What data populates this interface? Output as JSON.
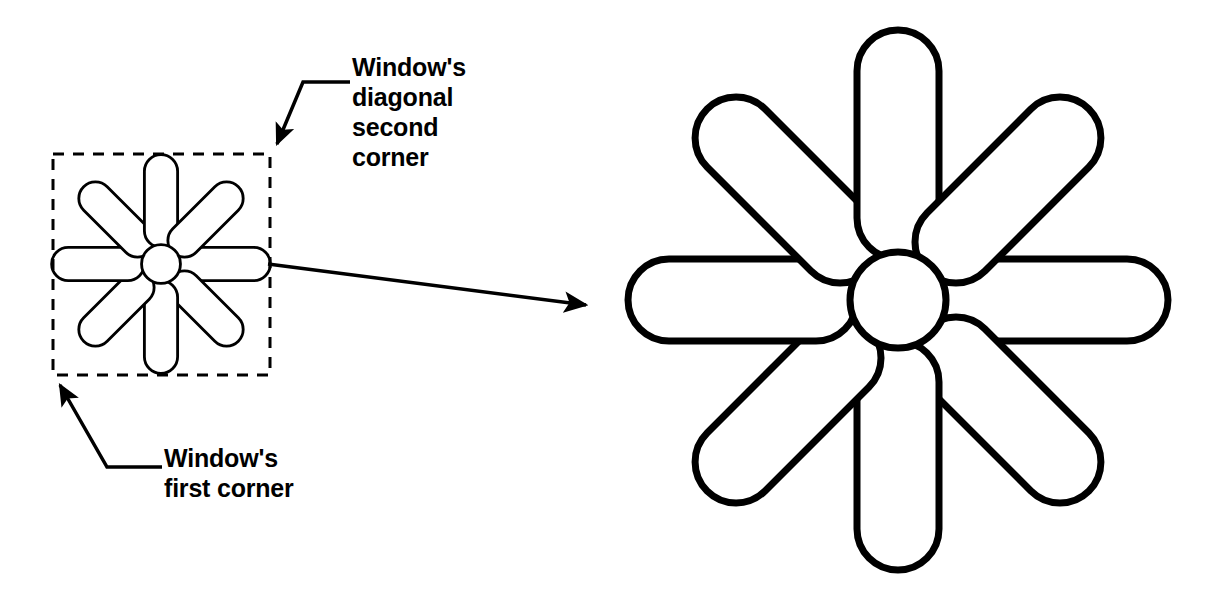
{
  "diagram": {
    "background_color": "#ffffff",
    "stroke_color": "#000000",
    "annotations": {
      "second_corner": {
        "text": "Window's\ndiagonal\nsecond\ncorner",
        "lines": [
          "Window's",
          "diagonal",
          "second",
          "corner"
        ],
        "points_to": "top-right corner of dashed selection window"
      },
      "first_corner": {
        "text": "Window's\nfirst corner",
        "lines": [
          "Window's",
          "first corner"
        ],
        "points_to": "bottom-left corner of dashed selection window"
      }
    },
    "selection_window": {
      "style": "dashed",
      "x": 53,
      "y": 154,
      "width": 217,
      "height": 221
    },
    "zoom_arrow": {
      "from": [
        268,
        264
      ],
      "to": [
        598,
        307
      ],
      "description": "arrow from small figure to enlarged figure"
    },
    "figures": [
      {
        "name": "small-asterisk-figure",
        "center": [
          161,
          264
        ],
        "scale": 0.405,
        "petal_count": 8,
        "has_center_circle": true
      },
      {
        "name": "large-asterisk-figure",
        "center": [
          898,
          300
        ],
        "scale": 1.0,
        "petal_count": 8,
        "has_center_circle": true
      }
    ],
    "geometry": {
      "center_circle_radius": 50,
      "petal_inner_radius": 82,
      "petal_outer_radius": 270,
      "petal_half_width": 41,
      "petal_angles_deg": [
        0,
        45,
        90,
        135,
        180,
        225,
        270,
        315
      ],
      "stroke_width": 7
    }
  }
}
